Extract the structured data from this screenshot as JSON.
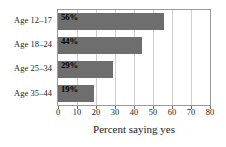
{
  "chart_data": {
    "type": "bar",
    "orientation": "horizontal",
    "title": "",
    "xlabel": "Percent saying yes",
    "ylabel": "",
    "xlim": [
      0,
      80
    ],
    "xticks": [
      0,
      10,
      20,
      30,
      40,
      50,
      60,
      70,
      80
    ],
    "xtick_labels": [
      "0",
      "10",
      "20",
      "30",
      "40",
      "50",
      "60",
      "70",
      "80"
    ],
    "grid": "vertical",
    "legend": "none",
    "categories": [
      "Age 12–17",
      "Age 18–24",
      "Age 25–34",
      "Age 35–44"
    ],
    "values": [
      56,
      44,
      29,
      19
    ],
    "data_labels": [
      "56%",
      "44%",
      "29%",
      "19%"
    ],
    "bars": [
      {
        "category": "Age 12–17",
        "value": 56,
        "label": "56%"
      },
      {
        "category": "Age 18–24",
        "value": 44,
        "label": "44%"
      },
      {
        "category": "Age 25–34",
        "value": 29,
        "label": "29%"
      },
      {
        "category": "Age 35–44",
        "value": 19,
        "label": "19%"
      }
    ],
    "colors": {
      "bar_fill": "#6e6e6e",
      "frame": "#9a9a9a",
      "gridline": "#cfcfcf",
      "background": "#ffffff",
      "text": "#1a1a1a",
      "data_label": "#000000"
    }
  }
}
